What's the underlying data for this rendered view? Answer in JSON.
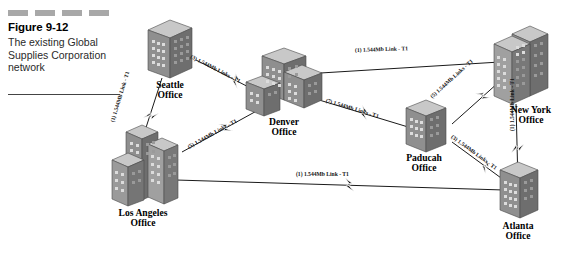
{
  "caption": {
    "figure_number": "Figure 9-12",
    "description_line1": "The existing Global",
    "description_line2": "Supplies Corporation",
    "description_line3": "network",
    "dash_count": 4,
    "dash_color": "#a8a8a8"
  },
  "diagram": {
    "title": "Global Supplies Corporation network",
    "nodes": [
      {
        "id": "seattle",
        "name_line1": "Seattle",
        "name_line2": "Office",
        "building": "tower-single"
      },
      {
        "id": "denver",
        "name_line1": "Denver",
        "name_line2": "Office",
        "building": "complex-wide"
      },
      {
        "id": "newyork",
        "name_line1": "New York",
        "name_line2": "Office",
        "building": "tower-double-tall"
      },
      {
        "id": "paducah",
        "name_line1": "Paducah",
        "name_line2": "Office",
        "building": "tower-single"
      },
      {
        "id": "atlanta",
        "name_line1": "Atlanta",
        "name_line2": "Office",
        "building": "tower-single"
      },
      {
        "id": "losangeles",
        "name_line1": "Los Angeles",
        "name_line2": "Office",
        "building": "tower-double"
      }
    ],
    "links": [
      {
        "id": "seattle-denver",
        "from": "seattle",
        "to": "denver",
        "label": "(3) 1.544Mb Links - T1",
        "bolt": true
      },
      {
        "id": "seattle-losangeles",
        "from": "seattle",
        "to": "losangeles",
        "label": "(1) 1.544Mb Link - T1",
        "bolt": true
      },
      {
        "id": "losangeles-denver",
        "from": "losangeles",
        "to": "denver",
        "label": "(5) 1.544Mb Links - T1",
        "bolt": true
      },
      {
        "id": "denver-newyork",
        "from": "denver",
        "to": "newyork",
        "label": "(1) 1.544Mb Link - T1",
        "bolt": false
      },
      {
        "id": "denver-paducah",
        "from": "denver",
        "to": "paducah",
        "label": "(7) 1.544Mb Links - T1",
        "bolt": true
      },
      {
        "id": "paducah-newyork",
        "from": "paducah",
        "to": "newyork",
        "label": "(5) 1.544Mb Links - T1",
        "bolt": true
      },
      {
        "id": "paducah-atlanta",
        "from": "paducah",
        "to": "atlanta",
        "label": "(3) 1.544Mb Links - T1",
        "bolt": true
      },
      {
        "id": "newyork-atlanta",
        "from": "newyork",
        "to": "atlanta",
        "label": "(1) 1.544Mb Link - T1",
        "bolt": true
      },
      {
        "id": "losangeles-atlanta",
        "from": "losangeles",
        "to": "atlanta",
        "label": "(1) 1.544Mb Link - T1",
        "bolt": true
      }
    ],
    "colors": {
      "building_front": "#a0a0a0",
      "building_side": "#707070",
      "building_top": "#c8c8c8",
      "line": "#1a1a1a",
      "window": "#d8d8d8"
    }
  }
}
